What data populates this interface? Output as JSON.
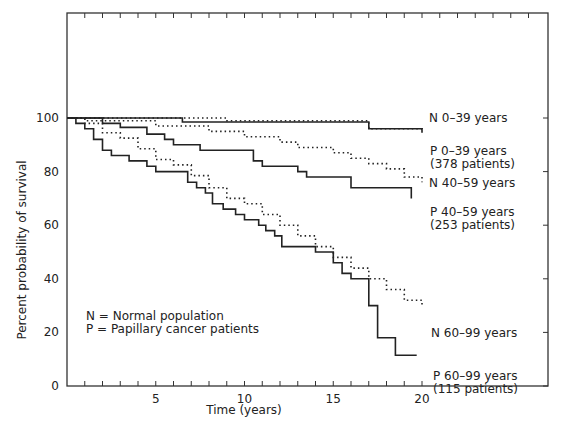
{
  "chart_data": {
    "type": "line",
    "title": "",
    "xlabel": "Time (years)",
    "ylabel": "Percent probability of survival",
    "xlim": [
      0,
      27
    ],
    "ylim": [
      0,
      138
    ],
    "xticks": [
      5,
      10,
      15,
      20
    ],
    "yticks": [
      0,
      20,
      40,
      60,
      80,
      100
    ],
    "grid": false,
    "legend_note": [
      "N = Normal population",
      "P = Papillary cancer patients"
    ],
    "series": [
      {
        "name": "N 0-39 years",
        "style": "dotted",
        "label": [
          "N 0–39 years"
        ],
        "points": [
          [
            0,
            100
          ],
          [
            9,
            100
          ],
          [
            9,
            99
          ],
          [
            17,
            99
          ],
          [
            17,
            96
          ],
          [
            20,
            96
          ],
          [
            20,
            95
          ]
        ]
      },
      {
        "name": "P 0-39 years (378 patients)",
        "style": "solid",
        "label": [
          "P  0–39 years",
          "(378 patients)"
        ],
        "points": [
          [
            0,
            100
          ],
          [
            6.5,
            100
          ],
          [
            6.5,
            98.5
          ],
          [
            17,
            98.5
          ],
          [
            17,
            96
          ],
          [
            20,
            96
          ],
          [
            20,
            94.5
          ]
        ]
      },
      {
        "name": "N 40-59 years",
        "style": "dotted",
        "label": [
          "N 40–59 years"
        ],
        "points": [
          [
            0,
            100
          ],
          [
            1,
            100
          ],
          [
            1,
            99
          ],
          [
            5,
            99
          ],
          [
            5,
            97
          ],
          [
            8,
            97
          ],
          [
            8,
            95
          ],
          [
            10,
            95
          ],
          [
            10,
            93
          ],
          [
            12,
            93
          ],
          [
            12,
            91
          ],
          [
            13,
            91
          ],
          [
            13,
            89
          ],
          [
            15,
            89
          ],
          [
            15,
            87
          ],
          [
            16,
            87
          ],
          [
            16,
            85
          ],
          [
            17,
            85
          ],
          [
            17,
            83
          ],
          [
            18,
            83
          ],
          [
            18,
            81
          ],
          [
            19,
            81
          ],
          [
            19,
            78
          ],
          [
            20,
            78
          ],
          [
            20,
            76
          ]
        ]
      },
      {
        "name": "P 40-59 years (253 patients)",
        "style": "solid",
        "label": [
          "P 40–59 years",
          "(253 patients)"
        ],
        "points": [
          [
            0,
            100
          ],
          [
            2,
            100
          ],
          [
            2,
            98
          ],
          [
            3,
            98
          ],
          [
            3,
            96.5
          ],
          [
            4.5,
            96.5
          ],
          [
            4.5,
            94
          ],
          [
            5.5,
            94
          ],
          [
            5.5,
            92
          ],
          [
            6,
            92
          ],
          [
            6,
            90
          ],
          [
            7.5,
            90
          ],
          [
            7.5,
            88
          ],
          [
            10.5,
            88
          ],
          [
            10.5,
            84
          ],
          [
            11,
            84
          ],
          [
            11,
            82
          ],
          [
            13,
            82
          ],
          [
            13,
            80
          ],
          [
            13.5,
            80
          ],
          [
            13.5,
            78
          ],
          [
            16,
            78
          ],
          [
            16,
            74
          ],
          [
            19.4,
            74
          ],
          [
            19.4,
            70
          ]
        ]
      },
      {
        "name": "N 60-99 years",
        "style": "dotted",
        "label": [
          "N 60–99 years"
        ],
        "points": [
          [
            0,
            100
          ],
          [
            1,
            100
          ],
          [
            1,
            98
          ],
          [
            2,
            98
          ],
          [
            2,
            94.5
          ],
          [
            3,
            94.5
          ],
          [
            3,
            92.5
          ],
          [
            4,
            92.5
          ],
          [
            4,
            88.5
          ],
          [
            5,
            88.5
          ],
          [
            5,
            84.5
          ],
          [
            6,
            84.5
          ],
          [
            6,
            82.5
          ],
          [
            7,
            82.5
          ],
          [
            7,
            78.5
          ],
          [
            8,
            78.5
          ],
          [
            8,
            74
          ],
          [
            9,
            74
          ],
          [
            9,
            70
          ],
          [
            10,
            70
          ],
          [
            10,
            68
          ],
          [
            11,
            68
          ],
          [
            11,
            64
          ],
          [
            12,
            64
          ],
          [
            12,
            60
          ],
          [
            13,
            60
          ],
          [
            13,
            56
          ],
          [
            14,
            56
          ],
          [
            14,
            52
          ],
          [
            15,
            52
          ],
          [
            15,
            48
          ],
          [
            16,
            48
          ],
          [
            16,
            44
          ],
          [
            17,
            44
          ],
          [
            17,
            40
          ],
          [
            18,
            40
          ],
          [
            18,
            36
          ],
          [
            19,
            36
          ],
          [
            19,
            32
          ],
          [
            20,
            32
          ],
          [
            20,
            30
          ]
        ]
      },
      {
        "name": "P 60-99 years (115 patients)",
        "style": "solid",
        "label": [
          "P 60–99 years",
          "(115 patients)"
        ],
        "points": [
          [
            0,
            100
          ],
          [
            0.5,
            100
          ],
          [
            0.5,
            98
          ],
          [
            1,
            98
          ],
          [
            1,
            96
          ],
          [
            1.5,
            96
          ],
          [
            1.5,
            92
          ],
          [
            2,
            92
          ],
          [
            2,
            88
          ],
          [
            2.5,
            88
          ],
          [
            2.5,
            86
          ],
          [
            3.5,
            86
          ],
          [
            3.5,
            84
          ],
          [
            4.5,
            84
          ],
          [
            4.5,
            82
          ],
          [
            5,
            82
          ],
          [
            5,
            80
          ],
          [
            6.8,
            80
          ],
          [
            6.8,
            76
          ],
          [
            7.3,
            76
          ],
          [
            7.3,
            74
          ],
          [
            7.8,
            74
          ],
          [
            7.8,
            72
          ],
          [
            8.2,
            72
          ],
          [
            8.2,
            68
          ],
          [
            8.8,
            68
          ],
          [
            8.8,
            66
          ],
          [
            9.5,
            66
          ],
          [
            9.5,
            64
          ],
          [
            10,
            64
          ],
          [
            10,
            62
          ],
          [
            10.8,
            62
          ],
          [
            10.8,
            60
          ],
          [
            11.2,
            60
          ],
          [
            11.2,
            58
          ],
          [
            11.7,
            58
          ],
          [
            11.7,
            56
          ],
          [
            12.1,
            56
          ],
          [
            12.1,
            52
          ],
          [
            14,
            52
          ],
          [
            14,
            50
          ],
          [
            15,
            50
          ],
          [
            15,
            46
          ],
          [
            15.5,
            46
          ],
          [
            15.5,
            42
          ],
          [
            16,
            42
          ],
          [
            16,
            40
          ],
          [
            17,
            40
          ],
          [
            17,
            30
          ],
          [
            17.5,
            30
          ],
          [
            17.5,
            18
          ],
          [
            18.5,
            18
          ],
          [
            18.5,
            11.5
          ],
          [
            19.7,
            11.5
          ]
        ]
      }
    ]
  },
  "axes": {
    "xlabel": "Time (years)",
    "ylabel": "Percent probability of survival",
    "xtick_labels": [
      "5",
      "10",
      "15",
      "20"
    ],
    "ytick_labels": [
      "0",
      "20",
      "40",
      "60",
      "80",
      "100"
    ]
  },
  "legend": {
    "line1": "N = Normal population",
    "line2": "P = Papillary cancer patients"
  }
}
